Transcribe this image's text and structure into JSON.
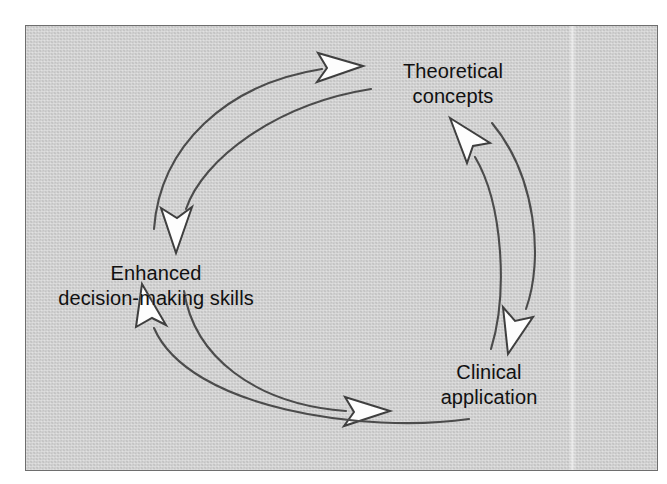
{
  "figure": {
    "kind": "cycle-diagram",
    "title": "",
    "background_color": "#cdcdcd",
    "border_color": "#6e6e6e",
    "page_color": "#ffffff",
    "stroke_color": "#4b4b4b",
    "arrowhead_fill": "#fdfdfd",
    "text_color": "#111111"
  },
  "nodes": [
    {
      "id": "theoretical",
      "lines": [
        "Theoretical",
        "concepts"
      ],
      "line1": "Theoretical",
      "line2": "concepts",
      "position": "top-right"
    },
    {
      "id": "enhanced",
      "lines": [
        "Enhanced",
        "decision-making skills"
      ],
      "line1": "Enhanced",
      "line2": "decision-making skills",
      "position": "left"
    },
    {
      "id": "clinical",
      "lines": [
        "Clinical",
        "application"
      ],
      "line1": "Clinical",
      "line2": "application",
      "position": "bottom-right"
    }
  ],
  "connections": [
    {
      "id": "enhanced-to-theoretical",
      "from": "Enhanced decision-making skills",
      "to": "Theoretical concepts",
      "side": "upper-left-outer"
    },
    {
      "id": "theoretical-to-enhanced",
      "from": "Theoretical concepts",
      "to": "Enhanced decision-making skills",
      "side": "upper-left-inner"
    },
    {
      "id": "enhanced-to-clinical",
      "from": "Enhanced decision-making skills",
      "to": "Clinical application",
      "side": "lower-left-inner"
    },
    {
      "id": "clinical-to-enhanced",
      "from": "Clinical application",
      "to": "Enhanced decision-making skills",
      "side": "lower-left-outer"
    },
    {
      "id": "clinical-to-theoretical",
      "from": "Clinical application",
      "to": "Theoretical concepts",
      "side": "right-inner"
    },
    {
      "id": "theoretical-to-clinical",
      "from": "Theoretical concepts",
      "to": "Clinical application",
      "side": "right-outer"
    }
  ]
}
